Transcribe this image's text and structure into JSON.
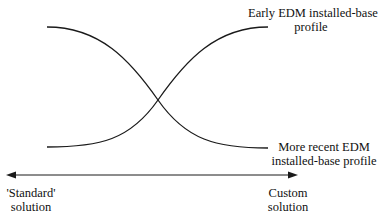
{
  "diagram": {
    "curves": [
      {
        "name": "early-edm-curve",
        "label_line1": "Early EDM installed-base",
        "label_line2": "profile",
        "direction": "rising"
      },
      {
        "name": "recent-edm-curve",
        "label_line1": "More recent EDM",
        "label_line2": "installed-base profile",
        "direction": "falling"
      }
    ],
    "axis": {
      "left_line1": "'Standard'",
      "left_line2": "solution",
      "right_line1": "Custom",
      "right_line2": "solution"
    },
    "colors": {
      "line": "#1a1a1a",
      "background": "#ffffff"
    }
  }
}
